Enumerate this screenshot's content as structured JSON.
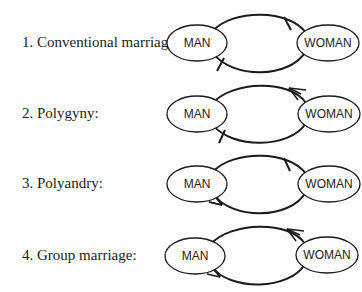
{
  "diagram": {
    "rows": [
      {
        "number": "1.",
        "label": "1.  Conventional marriage:",
        "left_node": "MAN",
        "right_node": "WOMAN",
        "top_arc_end": "one",
        "bottom_arc_end": "one"
      },
      {
        "number": "2.",
        "label": "2.  Polygyny:",
        "left_node": "MAN",
        "right_node": "WOMAN",
        "top_arc_end": "many",
        "bottom_arc_end": "one"
      },
      {
        "number": "3.",
        "label": "3.  Polyandry:",
        "left_node": "MAN",
        "right_node": "WOMAN",
        "top_arc_end": "one",
        "bottom_arc_end": "many"
      },
      {
        "number": "4.",
        "label": "4.  Group marriage:",
        "left_node": "MAN",
        "right_node": "WOMAN",
        "top_arc_end": "many",
        "bottom_arc_end": "many"
      }
    ],
    "colors": {
      "line": "#1a1a1a",
      "text": "#222222",
      "background": "#ffffff"
    }
  }
}
